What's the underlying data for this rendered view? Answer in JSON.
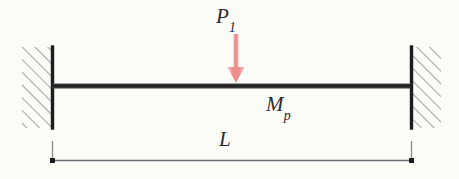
{
  "figure": {
    "background_color": "#fbfbf8",
    "ink_color": "#2b2b2b",
    "load_color": "#f08a8a"
  },
  "labels": {
    "load": {
      "symbol": "P",
      "subscript": "1",
      "full": "P1"
    },
    "plastic_moment": {
      "symbol": "M",
      "subscript": "p",
      "full": "Mp"
    },
    "span": {
      "symbol": "L",
      "full": "L"
    }
  },
  "supports": [
    {
      "name": "left-fixed-support",
      "type": "fixed",
      "x": 52,
      "y_top": 47,
      "y_bottom": 128
    },
    {
      "name": "right-fixed-support",
      "type": "fixed",
      "x": 411,
      "y_top": 47,
      "y_bottom": 128
    }
  ],
  "beam": {
    "x_start": 52,
    "x_end": 411,
    "y": 86,
    "thickness": 5
  },
  "load_arrow": {
    "x": 236,
    "y_tail": 34,
    "y_tip": 83,
    "shaft_width": 5,
    "head_width": 17,
    "head_height": 16,
    "direction": "down"
  },
  "dimension": {
    "name": "span-dimension",
    "x_start": 52,
    "x_end": 411,
    "y_line": 161,
    "y_extension_top": 141,
    "tick_style": "dot"
  }
}
